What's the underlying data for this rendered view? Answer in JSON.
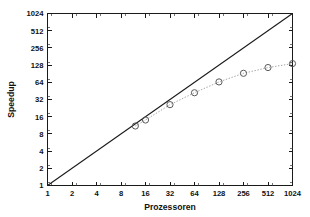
{
  "chart_data": {
    "type": "line",
    "title": "",
    "xlabel": "Prozessoren",
    "ylabel": "Speedup",
    "xscale": "log2",
    "yscale": "log2",
    "xlim": [
      1,
      1024
    ],
    "ylim": [
      1,
      1024
    ],
    "grid": false,
    "legend": "none",
    "xticks": [
      1,
      2,
      4,
      8,
      16,
      32,
      64,
      128,
      256,
      512,
      1024
    ],
    "xtick_labels": [
      "1",
      "2",
      "4",
      "8",
      "16",
      "32",
      "64",
      "128",
      "256",
      "512",
      "1024"
    ],
    "yticks": [
      1,
      2,
      4,
      8,
      16,
      32,
      64,
      128,
      256,
      512,
      1024
    ],
    "ytick_labels": [
      "1",
      "2",
      "4",
      "8",
      "16",
      "32",
      "64",
      "128",
      "256",
      "512",
      "1024"
    ],
    "series": [
      {
        "name": "ideal",
        "style": "solid",
        "marker": "none",
        "color": "#1a1a1a",
        "x": [
          1,
          1024
        ],
        "values": [
          1,
          1024
        ]
      },
      {
        "name": "measured",
        "style": "dotted",
        "marker": "circle",
        "color": "#5a5a5a",
        "x": [
          12,
          16,
          32,
          64,
          128,
          256,
          512,
          1024
        ],
        "values": [
          11,
          14,
          26,
          42,
          65,
          92,
          116,
          136
        ]
      }
    ]
  },
  "axes": {
    "x_title": "Prozessoren",
    "y_title": "Speedup"
  }
}
